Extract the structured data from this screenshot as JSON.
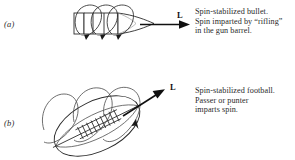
{
  "figure": {
    "background_color": "#ffffff",
    "ink_color": "#1a1a1a",
    "width": 295,
    "height": 160
  },
  "panels": [
    {
      "id": "a",
      "label": "(a)",
      "object": "spin-stabilized-bullet",
      "vector_label": "L",
      "vector_direction": "horizontal-right",
      "caption": "Spin-stabilized bullet.\nSpin imparted by “rifling”\nin the gun barrel.",
      "caption_lines": [
        "Spin-stabilized bullet.",
        "Spin imparted by “rifling”",
        "in the gun barrel."
      ]
    },
    {
      "id": "b",
      "label": "(b)",
      "object": "spin-stabilized-football",
      "vector_label": "L",
      "vector_direction": "diagonal-up-right",
      "caption": "Spin-stabilized football.\nPasser or punter\nimparts spin.",
      "caption_lines": [
        "Spin-stabilized football.",
        "Passer or punter",
        "imparts spin."
      ]
    }
  ]
}
